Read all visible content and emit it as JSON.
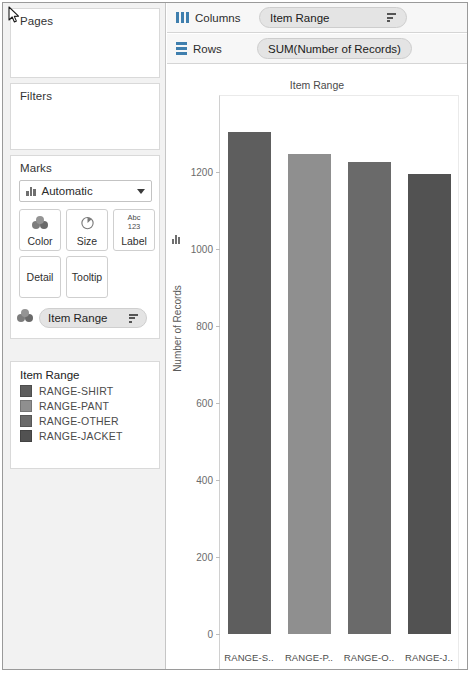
{
  "shelves": {
    "columns": {
      "label": "Columns",
      "icon": "columns-icon",
      "pill": "Item Range",
      "pill_sort_icon": "sort-descending-icon"
    },
    "rows": {
      "label": "Rows",
      "icon": "rows-icon",
      "pill": "SUM(Number of Records)"
    }
  },
  "left_panel": {
    "pages": {
      "title": "Pages"
    },
    "filters": {
      "title": "Filters"
    },
    "marks": {
      "title": "Marks",
      "mark_type": "Automatic",
      "mark_type_icon": "bar-chart-icon",
      "dropdown_icon": "chevron-down-icon",
      "buttons": [
        {
          "label": "Color",
          "icon": "color-circles-icon"
        },
        {
          "label": "Size",
          "icon": "size-pie-icon"
        },
        {
          "label": "Label",
          "icon": "abc-123-icon",
          "glyph_top": "Abc",
          "glyph_bottom": "123"
        },
        {
          "label": "Detail",
          "icon": "detail-icon"
        },
        {
          "label": "Tooltip",
          "icon": "tooltip-icon"
        }
      ],
      "encoding_pill": {
        "icon": "color-circles-icon",
        "label": "Item Range",
        "sort_icon": "sort-descending-icon"
      }
    },
    "legend": {
      "title": "Item Range",
      "items": [
        {
          "label": "RANGE-SHIRT",
          "color": "#5e5e5e"
        },
        {
          "label": "RANGE-PANT",
          "color": "#8f8f8f"
        },
        {
          "label": "RANGE-OTHER",
          "color": "#6a6a6a"
        },
        {
          "label": "RANGE-JACKET",
          "color": "#525252"
        }
      ]
    }
  },
  "chart_data": {
    "type": "bar",
    "title": "Item Range",
    "xlabel": "",
    "ylabel": "Number of Records",
    "ylim": [
      0,
      1400
    ],
    "grid": false,
    "legend_position": "left-panel",
    "yticks": [
      0,
      200,
      400,
      600,
      800,
      1000,
      1200
    ],
    "categories": [
      "RANGE-S..",
      "RANGE-P..",
      "RANGE-O..",
      "RANGE-J.."
    ],
    "category_full": [
      "RANGE-SHIRT",
      "RANGE-PANT",
      "RANGE-OTHER",
      "RANGE-JACKET"
    ],
    "values": [
      1303,
      1247,
      1226,
      1195
    ],
    "colors": [
      "#5e5e5e",
      "#8f8f8f",
      "#6a6a6a",
      "#525252"
    ]
  },
  "cursor": {
    "icon": "mouse-pointer-icon"
  }
}
